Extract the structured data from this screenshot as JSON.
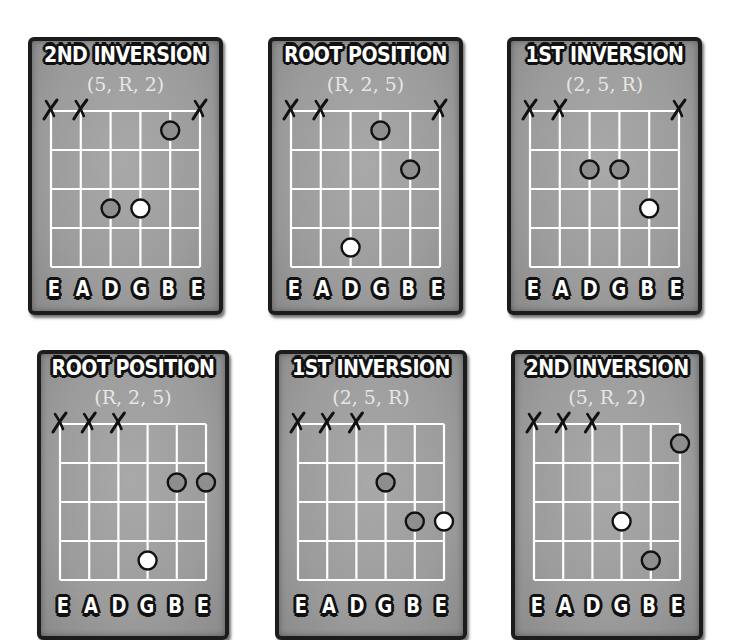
{
  "colors": {
    "card_bg": "#9c9c9c",
    "card_border": "#1c1c1c",
    "grid_line": "#ffffff",
    "dot_interval": "#8e8e8e",
    "dot_root": "#ffffff",
    "dot_outline": "#111111",
    "mute_mark": "#111111"
  },
  "string_names": [
    "E",
    "A",
    "D",
    "G",
    "B",
    "E"
  ],
  "num_frets": 4,
  "mute_symbol": "X",
  "diagrams": [
    {
      "title": "2ND INVERSION",
      "subtitle": "(5, R, 2)",
      "muted_strings": [
        0,
        1,
        5
      ],
      "notes": [
        {
          "string": 4,
          "fret": 1,
          "role": "5"
        },
        {
          "string": 2,
          "fret": 3,
          "role": "2"
        },
        {
          "string": 3,
          "fret": 3,
          "role": "R"
        }
      ]
    },
    {
      "title": "ROOT POSITION",
      "subtitle": "(R, 2, 5)",
      "muted_strings": [
        0,
        1,
        5
      ],
      "notes": [
        {
          "string": 3,
          "fret": 1,
          "role": "2"
        },
        {
          "string": 4,
          "fret": 2,
          "role": "5"
        },
        {
          "string": 2,
          "fret": 4,
          "role": "R"
        }
      ]
    },
    {
      "title": "1ST INVERSION",
      "subtitle": "(2, 5, R)",
      "muted_strings": [
        0,
        1,
        5
      ],
      "notes": [
        {
          "string": 2,
          "fret": 2,
          "role": "2"
        },
        {
          "string": 3,
          "fret": 2,
          "role": "5"
        },
        {
          "string": 4,
          "fret": 3,
          "role": "R"
        }
      ]
    },
    {
      "title": "ROOT POSITION",
      "subtitle": "(R, 2, 5)",
      "muted_strings": [
        0,
        1,
        2
      ],
      "notes": [
        {
          "string": 4,
          "fret": 2,
          "role": "2"
        },
        {
          "string": 5,
          "fret": 2,
          "role": "5"
        },
        {
          "string": 3,
          "fret": 4,
          "role": "R"
        }
      ]
    },
    {
      "title": "1ST INVERSION",
      "subtitle": "(2, 5, R)",
      "muted_strings": [
        0,
        1,
        2
      ],
      "notes": [
        {
          "string": 3,
          "fret": 2,
          "role": "2"
        },
        {
          "string": 4,
          "fret": 3,
          "role": "5"
        },
        {
          "string": 5,
          "fret": 3,
          "role": "R"
        }
      ]
    },
    {
      "title": "2ND INVERSION",
      "subtitle": "(5, R, 2)",
      "muted_strings": [
        0,
        1,
        2
      ],
      "notes": [
        {
          "string": 5,
          "fret": 1,
          "role": "5"
        },
        {
          "string": 3,
          "fret": 3,
          "role": "R"
        },
        {
          "string": 4,
          "fret": 4,
          "role": "2"
        }
      ]
    }
  ]
}
